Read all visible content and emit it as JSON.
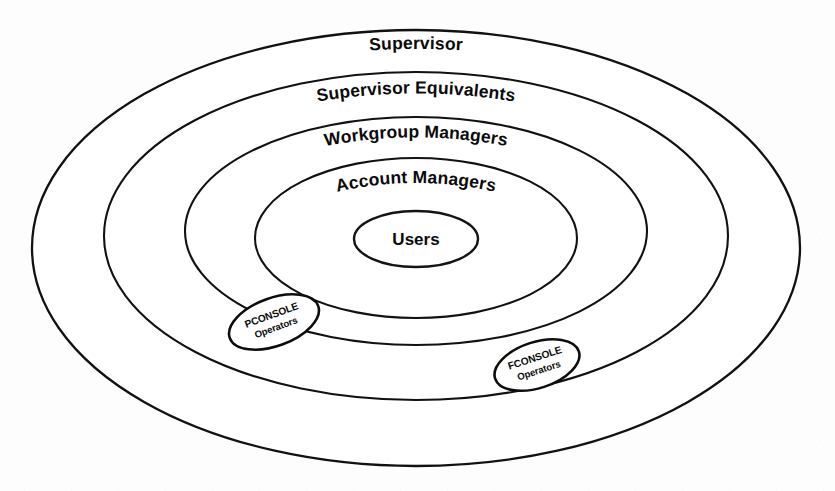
{
  "figure": {
    "type": "concentric-ellipse-hierarchy",
    "background_color": "#fdfdfd",
    "stroke_color": "#111111",
    "fill_color": "#ffffff",
    "rings": [
      {
        "id": "supervisor",
        "label": "Supervisor",
        "level": 1,
        "cx": 416,
        "cy": 248,
        "rx": 384,
        "ry": 218,
        "label_x": 416,
        "label_y": 57
      },
      {
        "id": "supervisor-equivalents",
        "label": "Supervisor Equivalents",
        "level": 2,
        "cx": 416,
        "cy": 236,
        "rx": 312,
        "ry": 164,
        "label_x": 416,
        "label_y": 103
      },
      {
        "id": "workgroup-managers",
        "label": "Workgroup Managers",
        "level": 3,
        "cx": 416,
        "cy": 231,
        "rx": 231,
        "ry": 114,
        "label_x": 416,
        "label_y": 145
      },
      {
        "id": "account-managers",
        "label": "Account Managers",
        "level": 4,
        "cx": 416,
        "cy": 238,
        "rx": 161,
        "ry": 80,
        "label_x": 416,
        "label_y": 191
      }
    ],
    "core": {
      "id": "users",
      "label": "Users",
      "level": 5,
      "cx": 416,
      "cy": 239,
      "rx": 62,
      "ry": 28,
      "label_x": 416,
      "label_y": 245
    },
    "callouts": [
      {
        "id": "pconsole-operators",
        "label_line1": "PCONSOLE",
        "label_line2": "Operators",
        "cx": 274,
        "cy": 322,
        "rx": 47,
        "ry": 24,
        "rotation": -20
      },
      {
        "id": "fconsole-operators",
        "label_line1": "FCONSOLE",
        "label_line2": "Operators",
        "cx": 537,
        "cy": 365,
        "rx": 44,
        "ry": 23,
        "rotation": -18
      }
    ]
  }
}
